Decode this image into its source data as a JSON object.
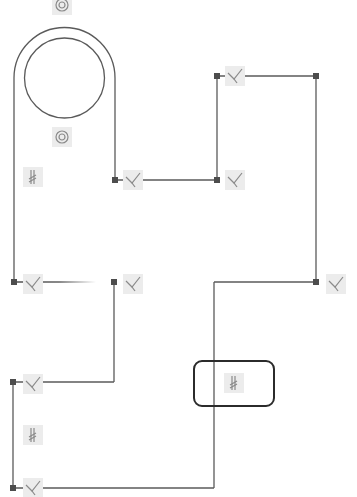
{
  "sketch": {
    "stroke_color": "#5a5a5a",
    "endpoint_color": "#4d4d4d",
    "glyph_bg_color": "#ececec",
    "glyph_stroke_color": "#8a8a8a",
    "selection_color": "#2b2b2b",
    "arcs": [
      {
        "name": "outer-arc",
        "cx": 64.5,
        "cy": 78,
        "r": 50.5,
        "from_x": 14,
        "to_x": 115,
        "y": 78
      }
    ],
    "circles": [
      {
        "name": "inner-circle",
        "cx": 64.5,
        "cy": 78,
        "r": 40
      }
    ],
    "lines": [
      {
        "name": "left-tab-side",
        "x1": 14,
        "y1": 78,
        "x2": 14,
        "y2": 282
      },
      {
        "name": "right-tab-side",
        "x1": 115,
        "y1": 78,
        "x2": 115,
        "y2": 180
      },
      {
        "name": "upper-step-horizontal",
        "x1": 115,
        "y1": 180,
        "x2": 217,
        "y2": 180
      },
      {
        "name": "upper-step-vertical",
        "x1": 217,
        "y1": 180,
        "x2": 217,
        "y2": 76
      },
      {
        "name": "top-right-horizontal",
        "x1": 217,
        "y1": 76,
        "x2": 316,
        "y2": 76
      },
      {
        "name": "right-side",
        "x1": 316,
        "y1": 76,
        "x2": 316,
        "y2": 282
      },
      {
        "name": "lower-right-horizontal",
        "x1": 316,
        "y1": 282,
        "x2": 214,
        "y2": 282
      },
      {
        "name": "lower-right-vertical",
        "x1": 214,
        "y1": 282,
        "x2": 214,
        "y2": 488
      },
      {
        "name": "bottom-horizontal",
        "x1": 214,
        "y1": 488,
        "x2": 13,
        "y2": 488
      },
      {
        "name": "bottom-left-vertical",
        "x1": 13,
        "y1": 488,
        "x2": 13,
        "y2": 382
      },
      {
        "name": "lower-left-horizontal",
        "x1": 13,
        "y1": 382,
        "x2": 114,
        "y2": 382
      },
      {
        "name": "lower-left-vertical",
        "x1": 114,
        "y1": 382,
        "x2": 114,
        "y2": 282
      }
    ],
    "partial_line": {
      "name": "fading-horizontal",
      "x1": 14,
      "y1": 282,
      "x2": 96,
      "y2": 282
    },
    "endpoints": [
      {
        "x": 115,
        "y": 180
      },
      {
        "x": 217,
        "y": 180
      },
      {
        "x": 217,
        "y": 76
      },
      {
        "x": 316,
        "y": 76
      },
      {
        "x": 316,
        "y": 282
      },
      {
        "x": 14,
        "y": 282
      },
      {
        "x": 114,
        "y": 282
      },
      {
        "x": 13,
        "y": 382
      },
      {
        "x": 13,
        "y": 488
      }
    ],
    "constraints": [
      {
        "type": "concentric",
        "icon": "concentric-icon",
        "x": 62,
        "y": 5
      },
      {
        "type": "concentric",
        "icon": "concentric-icon",
        "x": 62,
        "y": 137
      },
      {
        "type": "parallel",
        "icon": "parallel-icon",
        "x": 33,
        "y": 177
      },
      {
        "type": "perpendicular",
        "icon": "perpendicular-icon",
        "x": 133,
        "y": 180
      },
      {
        "type": "perpendicular",
        "icon": "perpendicular-icon",
        "x": 235,
        "y": 76
      },
      {
        "type": "perpendicular",
        "icon": "perpendicular-icon",
        "x": 235,
        "y": 180
      },
      {
        "type": "perpendicular",
        "icon": "perpendicular-icon",
        "x": 33,
        "y": 284
      },
      {
        "type": "perpendicular",
        "icon": "perpendicular-icon",
        "x": 133,
        "y": 284
      },
      {
        "type": "perpendicular",
        "icon": "perpendicular-icon",
        "x": 336,
        "y": 284
      },
      {
        "type": "perpendicular",
        "icon": "perpendicular-icon",
        "x": 33,
        "y": 384
      },
      {
        "type": "parallel",
        "icon": "parallel-icon",
        "x": 33,
        "y": 435
      },
      {
        "type": "perpendicular",
        "icon": "perpendicular-icon",
        "x": 33,
        "y": 488
      },
      {
        "type": "parallel",
        "icon": "parallel-icon",
        "x": 234,
        "y": 383,
        "selected": true
      }
    ],
    "selection_box": {
      "x": 194,
      "y": 361,
      "w": 80,
      "h": 45,
      "rx": 8
    }
  }
}
